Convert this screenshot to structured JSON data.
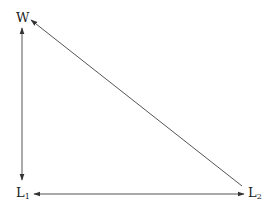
{
  "diagram": {
    "nodes": [
      {
        "id": "W",
        "label": "W",
        "sub": "",
        "x": 22,
        "y": 18
      },
      {
        "id": "L1",
        "label": "L",
        "sub": "1",
        "x": 22,
        "y": 192
      },
      {
        "id": "L2",
        "label": "L",
        "sub": "2",
        "x": 254,
        "y": 192
      }
    ],
    "edges": [
      {
        "from": "W",
        "to": "L1",
        "arrow_start": true,
        "arrow_end": true
      },
      {
        "from": "L2",
        "to": "L1",
        "arrow_start": true,
        "arrow_end": true
      },
      {
        "from": "L2",
        "to": "W",
        "arrow_start": false,
        "arrow_end": true
      }
    ],
    "colors": {
      "line": "#333333",
      "text": "#222222",
      "background": "#ffffff"
    }
  }
}
